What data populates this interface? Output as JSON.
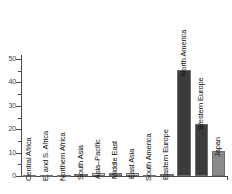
{
  "chart_data": {
    "type": "bar",
    "title": "",
    "subtitle": "",
    "xlabel": "",
    "ylabel": "",
    "ylim": [
      0,
      50
    ],
    "y_ticks": [
      0,
      10,
      20,
      30,
      40,
      50
    ],
    "y_minor_ticks": [
      5,
      15,
      25,
      35,
      45
    ],
    "grid": false,
    "legend": false,
    "categories": [
      "Central Africa",
      "E. and S. Africa",
      "Northern Africa",
      "South Asia",
      "Asia–Pacific",
      "Middle East",
      "East Asia",
      "South America",
      "Eastern Europe",
      "North America",
      "Western Europe",
      "Japan"
    ],
    "values": [
      0.2,
      0.3,
      0.4,
      0.9,
      1.1,
      1.2,
      1.3,
      0.5,
      0.8,
      45.3,
      22.2,
      10.7
    ],
    "bar_colors": [
      "#c9c9c9",
      "#c9c9c9",
      "#a8a8a8",
      "#bdbdbd",
      "#d6d6d6",
      "#7d7d7d",
      "#d0d0d0",
      "#b5b5b5",
      "#8f8f8f",
      "#3c3c3c",
      "#3c3c3c",
      "#8a8a8a"
    ],
    "label_rotation": -90,
    "axis_color": "#4a4a4a",
    "background": "#ffffff"
  }
}
